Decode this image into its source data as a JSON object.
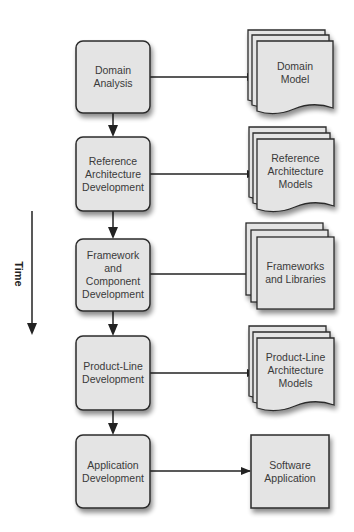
{
  "time_axis": {
    "label": "Time"
  },
  "processes": [
    {
      "label": "Domain\nAnalysis"
    },
    {
      "label": "Reference\nArchitecture\nDevelopment"
    },
    {
      "label": "Framework\nand\nComponent\nDevelopment"
    },
    {
      "label": "Product-Line\nDevelopment"
    },
    {
      "label": "Application\nDevelopment"
    }
  ],
  "artifacts": [
    {
      "label": "Domain\nModel",
      "shape": "document-stack"
    },
    {
      "label": "Reference\nArchitecture\nModels",
      "shape": "document-stack"
    },
    {
      "label": "Frameworks\nand Libraries",
      "shape": "box-stack"
    },
    {
      "label": "Product-Line\nArchitecture\nModels",
      "shape": "document-stack"
    },
    {
      "label": "Software\nApplication",
      "shape": "box"
    }
  ],
  "colors": {
    "fill": "#e4e4e4",
    "stroke": "#2b2b2b"
  }
}
